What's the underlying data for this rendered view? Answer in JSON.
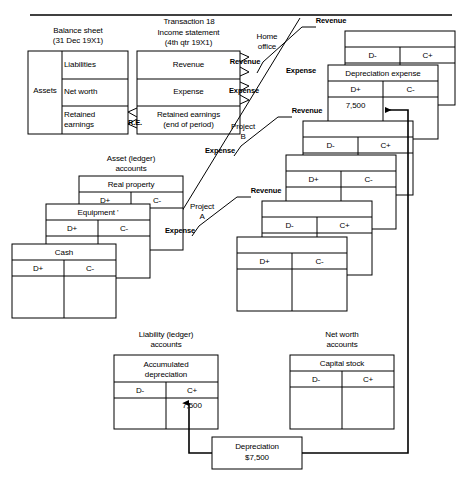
{
  "figure": {
    "top_rule": true,
    "transaction_title": "Transaction 18"
  },
  "balance_sheet": {
    "caption": "Balance sheet\n(31 Dec 19X1)",
    "assets": "Assets",
    "liabilities": "Liabilities",
    "net_worth": "Net worth",
    "retained_earnings": "Retained\nearnings"
  },
  "income_statement": {
    "caption": "Income statement\n(4th qtr 19X1)",
    "revenue": "Revenue",
    "expense": "Expense",
    "retained_earnings": "Retained earnings\n(end of period)"
  },
  "connector_labels": {
    "re": "R.E.",
    "revenue": "Revenue",
    "expense": "Expense"
  },
  "segments": {
    "home_office": "Home\noffice",
    "project_b": "Project\nB",
    "project_a": "Project\nA"
  },
  "asset_accounts": {
    "caption": "Asset (ledger)\naccounts",
    "accounts": [
      {
        "title": "Real property",
        "debit": "D+",
        "credit": "C-",
        "debit_value": "",
        "credit_value": ""
      },
      {
        "title": "Equipment '",
        "debit": "D+",
        "credit": "C-",
        "debit_value": "",
        "credit_value": ""
      },
      {
        "title": "Cash",
        "debit": "D+",
        "credit": "C-",
        "debit_value": "",
        "credit_value": ""
      }
    ]
  },
  "liability_accounts": {
    "caption": "Liability (ledger)\naccounts",
    "accounts": [
      {
        "title": "Accumulated\ndepreciation",
        "debit": "D-",
        "credit": "C+",
        "debit_value": "",
        "credit_value": "7,500"
      }
    ]
  },
  "net_worth_accounts": {
    "caption": "Net worth\naccounts",
    "accounts": [
      {
        "title": "Capital stock",
        "debit": "D-",
        "credit": "C+",
        "debit_value": "",
        "credit_value": ""
      }
    ]
  },
  "revenue_expense_accounts": [
    {
      "segment": "home-office",
      "kind": "revenue",
      "title": "",
      "debit": "D-",
      "credit": "C+",
      "debit_value": "",
      "credit_value": ""
    },
    {
      "segment": "home-office",
      "kind": "expense",
      "title": "Depreciation expense",
      "debit": "D+",
      "credit": "C-",
      "debit_value": "7,500",
      "credit_value": ""
    },
    {
      "segment": "project-b",
      "kind": "revenue",
      "title": "",
      "debit": "D-",
      "credit": "C+",
      "debit_value": "",
      "credit_value": ""
    },
    {
      "segment": "project-b",
      "kind": "expense",
      "title": "",
      "debit": "D+",
      "credit": "C-",
      "debit_value": "",
      "credit_value": ""
    },
    {
      "segment": "project-a",
      "kind": "revenue",
      "title": "",
      "debit": "D-",
      "credit": "C+",
      "debit_value": "",
      "credit_value": ""
    },
    {
      "segment": "project-a",
      "kind": "expense",
      "title": "",
      "debit": "D+",
      "credit": "C-",
      "debit_value": "",
      "credit_value": ""
    }
  ],
  "transaction_box": {
    "title": "Depreciation",
    "amount": "$7,500"
  },
  "colors": {
    "line": "#000000",
    "background": "#ffffff",
    "text": "#000000"
  }
}
